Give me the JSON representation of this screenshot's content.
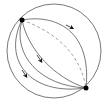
{
  "diagram": {
    "type": "sphere-geodesics",
    "colors": {
      "stroke": "#555555",
      "dashed": "#888888",
      "point": "#000000",
      "arrow": "#111111",
      "background": "#ffffff"
    },
    "points": [
      {
        "id": "top-left-pole",
        "x": 22,
        "y": 20
      },
      {
        "id": "bottom-right-pole",
        "x": 86,
        "y": 88
      }
    ],
    "paths": [
      {
        "id": "outer-circle",
        "style": "solid",
        "arrow": false
      },
      {
        "id": "upper-right-arc",
        "style": "solid",
        "arrow": true
      },
      {
        "id": "middle-arc",
        "style": "solid",
        "arrow": true
      },
      {
        "id": "lower-left-arc",
        "style": "solid",
        "arrow": true
      },
      {
        "id": "far-left-arc",
        "style": "solid",
        "arrow": false
      },
      {
        "id": "hidden-arc",
        "style": "dashed",
        "arrow": false
      }
    ]
  }
}
